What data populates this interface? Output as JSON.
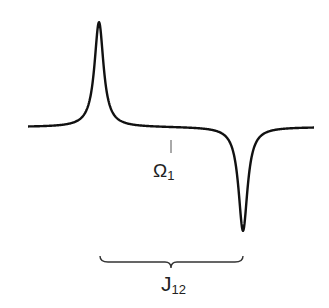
{
  "diagram": {
    "title": "",
    "spectrum": {
      "description": "Antiphase doublet: positive Lorentzian peak and negative Lorentzian peak",
      "line_color": "#111111",
      "peaks": [
        {
          "name": "positive-peak",
          "sign": "positive"
        },
        {
          "name": "negative-peak",
          "sign": "negative"
        }
      ]
    },
    "center_marker": {
      "symbol": "Ω",
      "subscript": "1"
    },
    "coupling_brace": {
      "symbol": "J",
      "subscript": "12"
    }
  }
}
